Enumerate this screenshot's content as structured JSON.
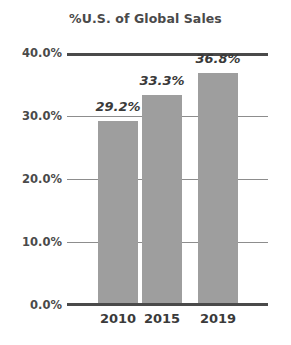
{
  "chart_data": {
    "type": "bar",
    "title": "%U.S. of Global Sales",
    "xlabel": "",
    "ylabel": "",
    "categories": [
      "2010",
      "2015",
      "2019"
    ],
    "values": [
      29.2,
      33.3,
      36.8
    ],
    "value_labels": [
      "29.2%",
      "33.3%",
      "36.8%"
    ],
    "ylim": [
      0.0,
      40.0
    ],
    "ytick_values": [
      0.0,
      10.0,
      20.0,
      30.0,
      40.0
    ],
    "ytick_labels": [
      "0.0%",
      "10.0%",
      "20.0%",
      "30.0%",
      "40.0%"
    ],
    "grid": true,
    "legend": false,
    "bar_color": "#9e9e9e",
    "axis_color": "#4a4a4a",
    "gridline_color": "#8d8d8d",
    "text_color": "#3a3a3a",
    "background_color": "#ffffff"
  }
}
